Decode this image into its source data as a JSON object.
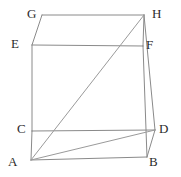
{
  "figure": {
    "type": "geometry-diagram",
    "shape": "cube",
    "canvas": {
      "width": 181,
      "height": 177,
      "background": "#ffffff"
    },
    "style": {
      "edge_color": "#8a8a8a",
      "diagonal_color": "#9a9a9a",
      "edge_width": 1,
      "label_color": "#2b2b2b",
      "label_font_size": 13
    },
    "vertices": [
      {
        "id": "G",
        "label": "G",
        "x": 42,
        "y": 15,
        "label_x": 27,
        "label_y": 7,
        "role": "back-top-left"
      },
      {
        "id": "H",
        "label": "H",
        "x": 144,
        "y": 15,
        "label_x": 152,
        "label_y": 7,
        "role": "back-top-right"
      },
      {
        "id": "E",
        "label": "E",
        "x": 32,
        "y": 45,
        "label_x": 11,
        "label_y": 37,
        "role": "front-top-left"
      },
      {
        "id": "F",
        "label": "F",
        "x": 143,
        "y": 46,
        "label_x": 146,
        "label_y": 38,
        "role": "front-top-right"
      },
      {
        "id": "C",
        "label": "C",
        "x": 32,
        "y": 131,
        "label_x": 17,
        "label_y": 122,
        "role": "front-bottom-left"
      },
      {
        "id": "D",
        "label": "D",
        "x": 155,
        "y": 130,
        "label_x": 159,
        "label_y": 122,
        "role": "back-bottom-right"
      },
      {
        "id": "A",
        "label": "A",
        "x": 31,
        "y": 160,
        "label_x": 8,
        "label_y": 155,
        "role": "front-bottom-left-lower"
      },
      {
        "id": "B",
        "label": "B",
        "x": 147,
        "y": 157,
        "label_x": 149,
        "label_y": 155,
        "role": "front-bottom-right-lower"
      }
    ],
    "edges": [
      {
        "from": "G",
        "to": "H",
        "kind": "edge"
      },
      {
        "from": "G",
        "to": "E",
        "kind": "edge"
      },
      {
        "from": "E",
        "to": "F",
        "kind": "edge"
      },
      {
        "from": "H",
        "to": "F",
        "kind": "edge"
      },
      {
        "from": "E",
        "to": "C",
        "kind": "edge"
      },
      {
        "from": "F",
        "to": "B",
        "kind": "edge"
      },
      {
        "from": "C",
        "to": "D",
        "kind": "edge"
      },
      {
        "from": "C",
        "to": "A",
        "kind": "edge"
      },
      {
        "from": "D",
        "to": "B",
        "kind": "edge"
      },
      {
        "from": "A",
        "to": "B",
        "kind": "edge"
      },
      {
        "from": "H",
        "to": "D",
        "kind": "edge"
      },
      {
        "from": "A",
        "to": "H",
        "kind": "diagonal"
      },
      {
        "from": "A",
        "to": "D",
        "kind": "diagonal"
      }
    ]
  }
}
